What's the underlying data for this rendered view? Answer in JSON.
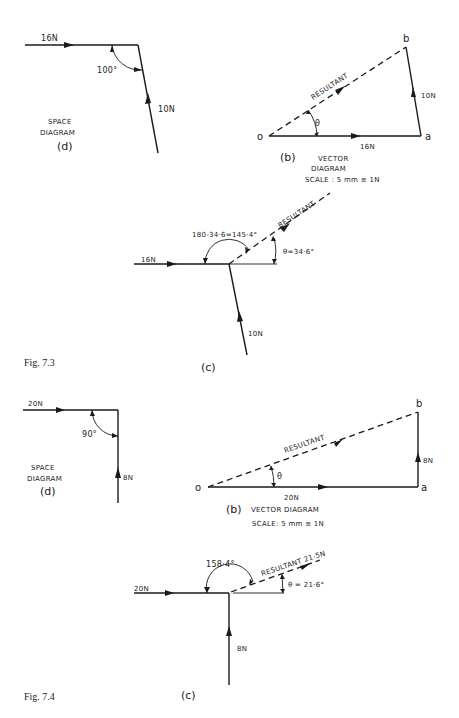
{
  "figures": [
    {
      "caption": "Fig. 7.3",
      "space_diagram": {
        "force_horizontal": "16N",
        "force_vertical": "10N",
        "angle": "100°",
        "title_line1": "SPACE",
        "title_line2": "DIAGRAM",
        "tag": "(d)"
      },
      "vector_diagram": {
        "point_o": "o",
        "point_a": "a",
        "point_b": "b",
        "side_oa": "16N",
        "side_ab": "10N",
        "resultant": "RESULTANT",
        "angle_symbol": "θ",
        "tag": "(b)",
        "title_line1": "VECTOR",
        "title_line2": "DIAGRAM",
        "scale": "SCALE : 5 mm ≡ 1N"
      },
      "resultant_diagram": {
        "force_horizontal": "16N",
        "force_vertical": "10N",
        "resultant": "RESULTANT",
        "obtuse_angle": "180-34·6=145·4°",
        "theta": "θ=34·6°",
        "tag": "(c)"
      }
    },
    {
      "caption": "Fig. 7.4",
      "space_diagram": {
        "force_horizontal": "20N",
        "force_vertical": "8N",
        "angle": "90°",
        "title_line1": "SPACE",
        "title_line2": "DIAGRAM",
        "tag": "(d)"
      },
      "vector_diagram": {
        "point_o": "o",
        "point_a": "a",
        "point_b": "b",
        "side_oa": "20N",
        "side_ab": "8N",
        "resultant": "RESULTANT",
        "angle_symbol": "θ",
        "tag": "(b)",
        "title": "VECTOR DIAGRAM",
        "scale": "SCALE: 5 mm ≡ 1N"
      },
      "resultant_diagram": {
        "force_horizontal": "20N",
        "force_vertical": "8N",
        "resultant": "RESULTANT 21·5N",
        "obtuse_angle": "158·4°",
        "theta": "θ = 21·6°",
        "tag": "(c)"
      }
    }
  ]
}
